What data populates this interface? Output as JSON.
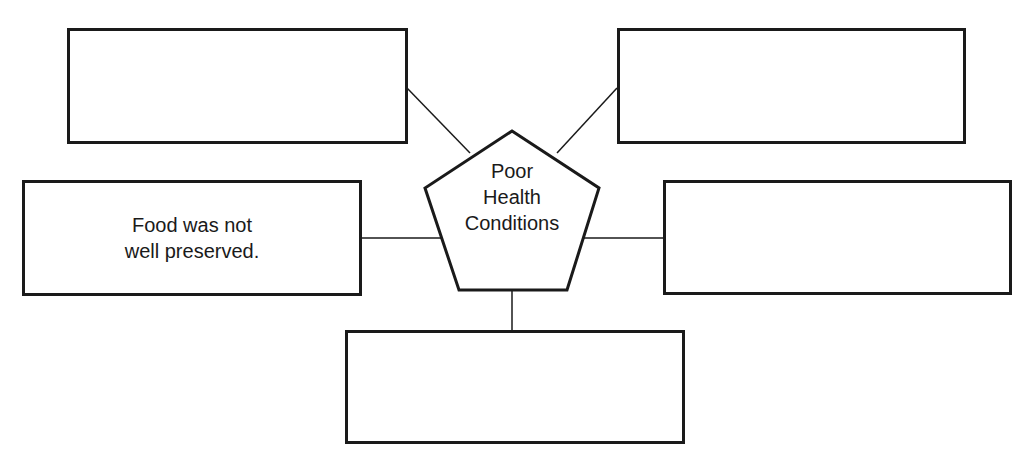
{
  "diagram": {
    "type": "web-organizer",
    "center": {
      "shape": "pentagon",
      "lines": [
        "Poor",
        "Health",
        "Conditions"
      ],
      "label": "Poor Health Conditions"
    },
    "boxes": [
      {
        "position": "top-left",
        "text": ""
      },
      {
        "position": "top-right",
        "text": ""
      },
      {
        "position": "middle-left",
        "text_lines": [
          "Food was not",
          "well preserved."
        ],
        "text": "Food was not well preserved."
      },
      {
        "position": "middle-right",
        "text": ""
      },
      {
        "position": "bottom",
        "text": ""
      }
    ],
    "colors": {
      "stroke": "#1a1a1a",
      "background": "#ffffff"
    }
  }
}
